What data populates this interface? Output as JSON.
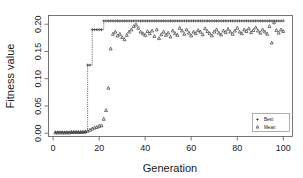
{
  "chart_data": {
    "type": "line",
    "title": "",
    "subtitle": "",
    "xlabel": "Generation",
    "ylabel": "Fitness value",
    "xlim": [
      -2,
      104
    ],
    "ylim": [
      -0.006,
      0.216
    ],
    "xticks": [
      0,
      20,
      40,
      60,
      80,
      100
    ],
    "yticks": [
      0.0,
      0.05,
      0.1,
      0.15,
      0.2
    ],
    "xticklabels": [
      "0",
      "20",
      "40",
      "60",
      "80",
      "100"
    ],
    "yticklabels": [
      "0.00",
      "0.05",
      "0.10",
      "0.15",
      "0.20"
    ],
    "grid": false,
    "legend_position": "bottom-right",
    "legend_entries": [
      {
        "label": "Best",
        "marker": "+",
        "color": "#3a3a3a"
      },
      {
        "label": "Mean",
        "marker": "triangle",
        "color": "#3a3a3a"
      }
    ],
    "x": [
      1,
      2,
      3,
      4,
      5,
      6,
      7,
      8,
      9,
      10,
      11,
      12,
      13,
      14,
      15,
      16,
      17,
      18,
      19,
      20,
      21,
      22,
      23,
      24,
      25,
      26,
      27,
      28,
      29,
      30,
      31,
      32,
      33,
      34,
      35,
      36,
      37,
      38,
      39,
      40,
      41,
      42,
      43,
      44,
      45,
      46,
      47,
      48,
      49,
      50,
      51,
      52,
      53,
      54,
      55,
      56,
      57,
      58,
      59,
      60,
      61,
      62,
      63,
      64,
      65,
      66,
      67,
      68,
      69,
      70,
      71,
      72,
      73,
      74,
      75,
      76,
      77,
      78,
      79,
      80,
      81,
      82,
      83,
      84,
      85,
      86,
      87,
      88,
      89,
      90,
      91,
      92,
      93,
      94,
      95,
      96,
      97,
      98,
      99,
      100
    ],
    "series": [
      {
        "name": "Best",
        "marker": "+",
        "color": "#3a3a3a",
        "values": [
          0.002,
          0.002,
          0.002,
          0.002,
          0.002,
          0.002,
          0.002,
          0.002,
          0.002,
          0.002,
          0.002,
          0.002,
          0.002,
          0.002,
          0.125,
          0.125,
          0.19,
          0.19,
          0.19,
          0.19,
          0.19,
          0.206,
          0.206,
          0.206,
          0.206,
          0.206,
          0.206,
          0.206,
          0.206,
          0.206,
          0.206,
          0.206,
          0.206,
          0.206,
          0.206,
          0.206,
          0.206,
          0.206,
          0.206,
          0.206,
          0.206,
          0.206,
          0.206,
          0.206,
          0.206,
          0.206,
          0.206,
          0.206,
          0.206,
          0.206,
          0.206,
          0.206,
          0.206,
          0.206,
          0.206,
          0.206,
          0.206,
          0.206,
          0.206,
          0.206,
          0.206,
          0.206,
          0.206,
          0.206,
          0.206,
          0.206,
          0.206,
          0.206,
          0.206,
          0.206,
          0.206,
          0.206,
          0.206,
          0.206,
          0.206,
          0.206,
          0.206,
          0.206,
          0.206,
          0.206,
          0.206,
          0.206,
          0.206,
          0.206,
          0.206,
          0.206,
          0.206,
          0.206,
          0.206,
          0.206,
          0.206,
          0.206,
          0.206,
          0.206,
          0.206,
          0.206,
          0.206,
          0.206,
          0.206,
          0.206
        ]
      },
      {
        "name": "Mean",
        "marker": "triangle",
        "color": "#3a3a3a",
        "values": [
          0.001,
          0.001,
          0.001,
          0.001,
          0.001,
          0.001,
          0.001,
          0.002,
          0.002,
          0.002,
          0.002,
          0.002,
          0.002,
          0.003,
          0.004,
          0.006,
          0.008,
          0.01,
          0.011,
          0.013,
          0.014,
          0.026,
          0.042,
          0.083,
          0.155,
          0.182,
          0.186,
          0.179,
          0.182,
          0.176,
          0.172,
          0.18,
          0.186,
          0.19,
          0.196,
          0.199,
          0.193,
          0.186,
          0.183,
          0.18,
          0.187,
          0.183,
          0.188,
          0.178,
          0.19,
          0.174,
          0.181,
          0.186,
          0.18,
          0.184,
          0.177,
          0.188,
          0.183,
          0.18,
          0.193,
          0.188,
          0.182,
          0.19,
          0.184,
          0.179,
          0.186,
          0.183,
          0.189,
          0.186,
          0.181,
          0.192,
          0.187,
          0.183,
          0.179,
          0.186,
          0.19,
          0.184,
          0.181,
          0.188,
          0.185,
          0.191,
          0.186,
          0.182,
          0.188,
          0.193,
          0.186,
          0.183,
          0.19,
          0.187,
          0.192,
          0.185,
          0.189,
          0.194,
          0.188,
          0.184,
          0.19,
          0.186,
          0.182,
          0.196,
          0.166,
          0.203,
          0.189,
          0.184,
          0.19,
          0.187
        ]
      }
    ]
  },
  "axes": {
    "xlabel": "Generation",
    "ylabel": "Fitness value"
  }
}
